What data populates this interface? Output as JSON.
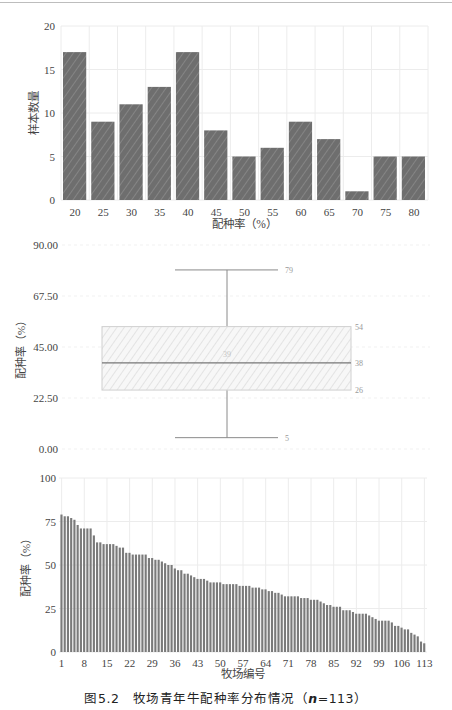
{
  "figure": {
    "caption_prefix": "图5.2",
    "caption_text": "牧场青年牛配种率分布情况（",
    "caption_n_label": "n",
    "caption_n_value": "=113）"
  },
  "colors": {
    "bar_fill": "#6e6e6e",
    "bar_hatch": "#858585",
    "grid": "#ececec",
    "box_fill": "#f4f4f4",
    "box_line": "#8a8a8a",
    "annot_text": "#9a9a9a",
    "thin_bar": "#7a7a7a"
  },
  "chart_data": [
    {
      "type": "bar",
      "title": "",
      "xlabel": "配种率（%）",
      "ylabel": "样本数量",
      "categories": [
        "20",
        "25",
        "30",
        "35",
        "40",
        "45",
        "50",
        "55",
        "60",
        "65",
        "70",
        "75",
        "80"
      ],
      "values": [
        17,
        9,
        11,
        13,
        17,
        8,
        5,
        6,
        9,
        7,
        1,
        5,
        5
      ],
      "ylim": [
        0,
        20
      ],
      "yticks": [
        "0",
        "5",
        "10",
        "15",
        "20"
      ],
      "grid": true
    },
    {
      "type": "box",
      "title": "",
      "xlabel": "",
      "ylabel": "配种率（%）",
      "ylim": [
        0,
        90
      ],
      "yticks": [
        "0.00",
        "22.50",
        "45.00",
        "67.50",
        "90.00"
      ],
      "whisker_max": 79,
      "q3": 54,
      "median": 38,
      "q1": 26,
      "whisker_min": 5,
      "center_label": "39",
      "annotations": [
        "79",
        "54",
        "38",
        "26",
        "5"
      ],
      "grid": true
    },
    {
      "type": "bar",
      "title": "",
      "xlabel": "牧场编号",
      "ylabel": "配种率（%）",
      "ylim": [
        0,
        100
      ],
      "yticks": [
        "0",
        "25",
        "50",
        "75",
        "100"
      ],
      "xticks": [
        "1",
        "8",
        "15",
        "22",
        "29",
        "36",
        "43",
        "50",
        "57",
        "64",
        "71",
        "78",
        "85",
        "92",
        "99",
        "106",
        "113"
      ],
      "x": "1..113",
      "values": [
        79,
        78,
        78,
        77,
        76,
        73,
        71,
        71,
        71,
        71,
        67,
        63,
        63,
        62,
        62,
        62,
        62,
        61,
        60,
        60,
        57,
        57,
        56,
        56,
        56,
        56,
        56,
        54,
        54,
        53,
        53,
        52,
        51,
        50,
        50,
        48,
        47,
        47,
        45,
        45,
        44,
        43,
        42,
        42,
        42,
        41,
        40,
        40,
        40,
        40,
        39,
        39,
        39,
        39,
        39,
        38,
        38,
        38,
        38,
        37,
        37,
        37,
        36,
        36,
        35,
        35,
        34,
        34,
        33,
        32,
        32,
        32,
        32,
        32,
        31,
        31,
        31,
        30,
        30,
        30,
        29,
        28,
        27,
        27,
        26,
        26,
        26,
        24,
        24,
        24,
        23,
        22,
        22,
        22,
        22,
        21,
        20,
        19,
        18,
        18,
        18,
        18,
        17,
        15,
        15,
        14,
        13,
        13,
        11,
        10,
        9,
        6,
        5
      ],
      "grid": true
    }
  ]
}
